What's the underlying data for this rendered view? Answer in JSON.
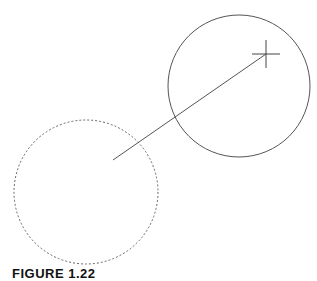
{
  "figure": {
    "caption": "FIGURE 1.22",
    "stroke_color": "#555555",
    "dashed_circle": {
      "cx": 86,
      "cy": 192,
      "r": 72
    },
    "solid_circle": {
      "cx": 239,
      "cy": 86,
      "r": 71
    },
    "vector_line": {
      "x1": 113,
      "y1": 160,
      "x2": 266,
      "y2": 54
    },
    "crosshair": {
      "cx": 266,
      "cy": 54,
      "half": 14
    }
  }
}
